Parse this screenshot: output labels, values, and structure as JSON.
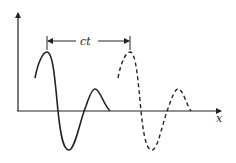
{
  "diagram": {
    "axes": {
      "x_label": "x",
      "y_label": ""
    },
    "displacement_label": "ct",
    "curves": [
      {
        "name": "pulse-at-t0",
        "style": "solid"
      },
      {
        "name": "pulse-at-t",
        "style": "dashed"
      }
    ],
    "colors": {
      "ink": "#222222",
      "background": "#ffffff"
    }
  }
}
